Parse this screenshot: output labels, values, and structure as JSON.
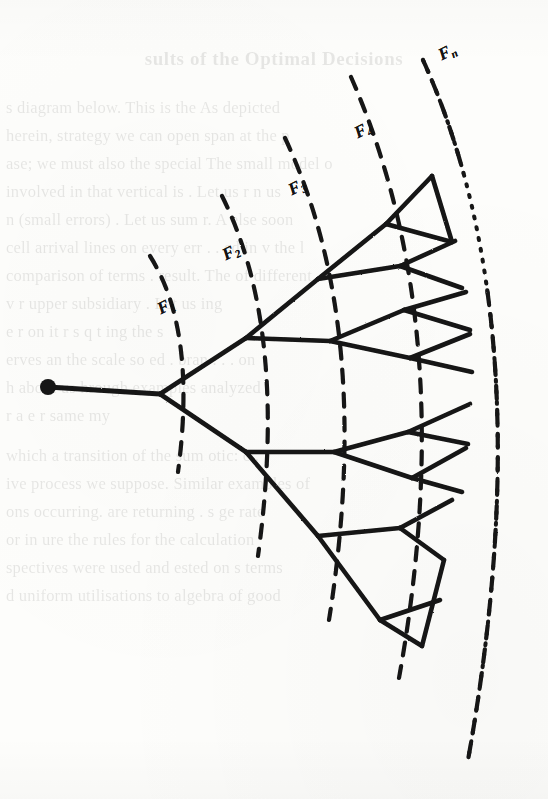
{
  "page": {
    "width": 548,
    "height": 799,
    "background_color": "#fdfdfb",
    "ink_color": "#141414"
  },
  "ghost_text": {
    "note": "faint show-through text from the underlying/reverse page of the scan",
    "heading": "sults of the Optimal Decisions",
    "lines": [
      "s diagram below.  This is the     As depicted",
      "herein, strategy we can open span at the p",
      "ase; we must also the special The small model o",
      "involved in that vertical is  . Let us     r    n  us",
      "n  (small errors) . Let us sum r. A  else soon",
      "cell arrival lines on every err  . . ed in  v  the l",
      "comparison of terms   .  result. The  of different",
      "v  r   upper subsidiary         . Let us  ing",
      "e  r   on  it  r  s  q  t  ing the  s",
      "erves  an the scale so  ed   .   bran  . . . on",
      "h  about  us  hrough examples analyzed   i",
      "r   a   e   r    same   my",
      "which  a transition of the sum otic: c  .",
      "ive process we suppose. Similar examples  of",
      "ons occurring.  are returning   .   s   ge  rate",
      "or in  ure the  rules for the   calculation",
      "spectives were  used and  ested on    s  terms",
      "d  uniform  utilisations   to    algebra of good"
    ]
  },
  "figure": {
    "name": "fan-decision-tree",
    "caption_labels": [
      {
        "id": "F1",
        "base": "F",
        "sub": "1",
        "x": 163,
        "y": 300,
        "rotate": -27
      },
      {
        "id": "F2",
        "base": "F",
        "sub": "2",
        "x": 228,
        "y": 246,
        "rotate": -27
      },
      {
        "id": "F3",
        "base": "F",
        "sub": "3",
        "x": 294,
        "y": 181,
        "rotate": -27
      },
      {
        "id": "F4",
        "base": "F",
        "sub": "4",
        "x": 360,
        "y": 124,
        "rotate": -27
      },
      {
        "id": "Fn",
        "base": "F",
        "sub": "n",
        "x": 444,
        "y": 46,
        "rotate": -27
      }
    ],
    "root_node": {
      "cx": 48,
      "cy": 387,
      "r": 8
    },
    "stem": {
      "x1": 48,
      "y1": 387,
      "x2": 160,
      "y2": 394
    },
    "arcs": [
      {
        "id": "F1",
        "d": "M 150 256 Q 197 330 178 472"
      },
      {
        "id": "F2",
        "d": "M 222 196 Q 289 330 258 556"
      },
      {
        "id": "F3",
        "d": "M 285 138 Q 375 330 329 620"
      },
      {
        "id": "F4",
        "d": "M 351 77 Q 462 330 399 678"
      },
      {
        "id": "Fn",
        "d": "M 423 60 Q 545 330 468 760",
        "style": "dotted-top"
      }
    ],
    "edges": [
      {
        "x1": 160,
        "y1": 394,
        "x2": 246,
        "y2": 338
      },
      {
        "x1": 160,
        "y1": 394,
        "x2": 246,
        "y2": 452
      },
      {
        "x1": 246,
        "y1": 338,
        "x2": 318,
        "y2": 279
      },
      {
        "x1": 246,
        "y1": 338,
        "x2": 330,
        "y2": 341
      },
      {
        "x1": 246,
        "y1": 452,
        "x2": 334,
        "y2": 452
      },
      {
        "x1": 246,
        "y1": 452,
        "x2": 318,
        "y2": 536
      },
      {
        "x1": 318,
        "y1": 279,
        "x2": 386,
        "y2": 224
      },
      {
        "x1": 318,
        "y1": 279,
        "x2": 400,
        "y2": 266
      },
      {
        "x1": 330,
        "y1": 341,
        "x2": 404,
        "y2": 310
      },
      {
        "x1": 330,
        "y1": 341,
        "x2": 410,
        "y2": 358
      },
      {
        "x1": 334,
        "y1": 452,
        "x2": 408,
        "y2": 432
      },
      {
        "x1": 334,
        "y1": 452,
        "x2": 412,
        "y2": 478
      },
      {
        "x1": 318,
        "y1": 536,
        "x2": 400,
        "y2": 528
      },
      {
        "x1": 318,
        "y1": 536,
        "x2": 380,
        "y2": 620
      },
      {
        "x1": 386,
        "y1": 224,
        "x2": 432,
        "y2": 176
      },
      {
        "x1": 386,
        "y1": 224,
        "x2": 452,
        "y2": 242
      },
      {
        "x1": 400,
        "y1": 266,
        "x2": 455,
        "y2": 241
      },
      {
        "x1": 400,
        "y1": 266,
        "x2": 462,
        "y2": 288
      },
      {
        "x1": 404,
        "y1": 310,
        "x2": 466,
        "y2": 292
      },
      {
        "x1": 404,
        "y1": 310,
        "x2": 470,
        "y2": 330
      },
      {
        "x1": 410,
        "y1": 358,
        "x2": 470,
        "y2": 334
      },
      {
        "x1": 410,
        "y1": 358,
        "x2": 472,
        "y2": 372
      },
      {
        "x1": 408,
        "y1": 432,
        "x2": 470,
        "y2": 404
      },
      {
        "x1": 408,
        "y1": 432,
        "x2": 468,
        "y2": 444
      },
      {
        "x1": 412,
        "y1": 478,
        "x2": 466,
        "y2": 448
      },
      {
        "x1": 412,
        "y1": 478,
        "x2": 462,
        "y2": 492
      },
      {
        "x1": 400,
        "y1": 528,
        "x2": 452,
        "y2": 500
      },
      {
        "x1": 400,
        "y1": 528,
        "x2": 444,
        "y2": 560
      },
      {
        "x1": 380,
        "y1": 620,
        "x2": 440,
        "y2": 600
      },
      {
        "x1": 380,
        "y1": 620,
        "x2": 422,
        "y2": 646
      },
      {
        "x1": 432,
        "y1": 176,
        "x2": 452,
        "y2": 242
      },
      {
        "x1": 444,
        "y1": 560,
        "x2": 422,
        "y2": 646
      }
    ]
  }
}
